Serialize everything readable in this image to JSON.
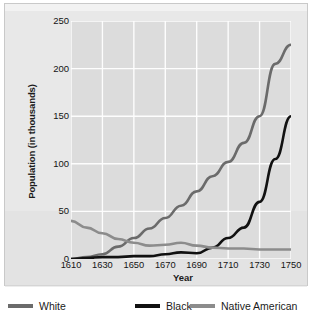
{
  "chart_data": {
    "type": "line",
    "title": "",
    "xlabel": "Year",
    "ylabel": "Population (in thousands)",
    "xlim": [
      1610,
      1750
    ],
    "ylim": [
      0,
      250
    ],
    "grid": true,
    "legend_position": "bottom",
    "xticks": [
      "1610",
      "1630",
      "1650",
      "1670",
      "1690",
      "1710",
      "1730",
      "1750"
    ],
    "yticks": [
      "0",
      "50",
      "100",
      "150",
      "200",
      "250"
    ],
    "x": [
      1610,
      1620,
      1630,
      1640,
      1650,
      1660,
      1670,
      1680,
      1690,
      1700,
      1710,
      1720,
      1730,
      1740,
      1750
    ],
    "series": [
      {
        "name": "White",
        "color": "#6b6b6b",
        "values": [
          0,
          2,
          5,
          13,
          22,
          32,
          43,
          56,
          71,
          87,
          102,
          122,
          150,
          205,
          225
        ]
      },
      {
        "name": "Black",
        "color": "#111111",
        "values": [
          0,
          1,
          2,
          2,
          3,
          3,
          5,
          7,
          6,
          12,
          22,
          33,
          60,
          105,
          150
        ]
      },
      {
        "name": "Native American",
        "color": "#8c8c8c",
        "values": [
          40,
          33,
          27,
          21,
          17,
          14,
          15,
          17,
          14,
          12,
          11,
          11,
          10,
          10,
          10
        ]
      }
    ]
  },
  "legend": {
    "items": [
      {
        "label": "White",
        "color": "#6b6b6b"
      },
      {
        "label": "Black",
        "color": "#111111"
      },
      {
        "label": "Native American",
        "color": "#8c8c8c"
      }
    ]
  }
}
